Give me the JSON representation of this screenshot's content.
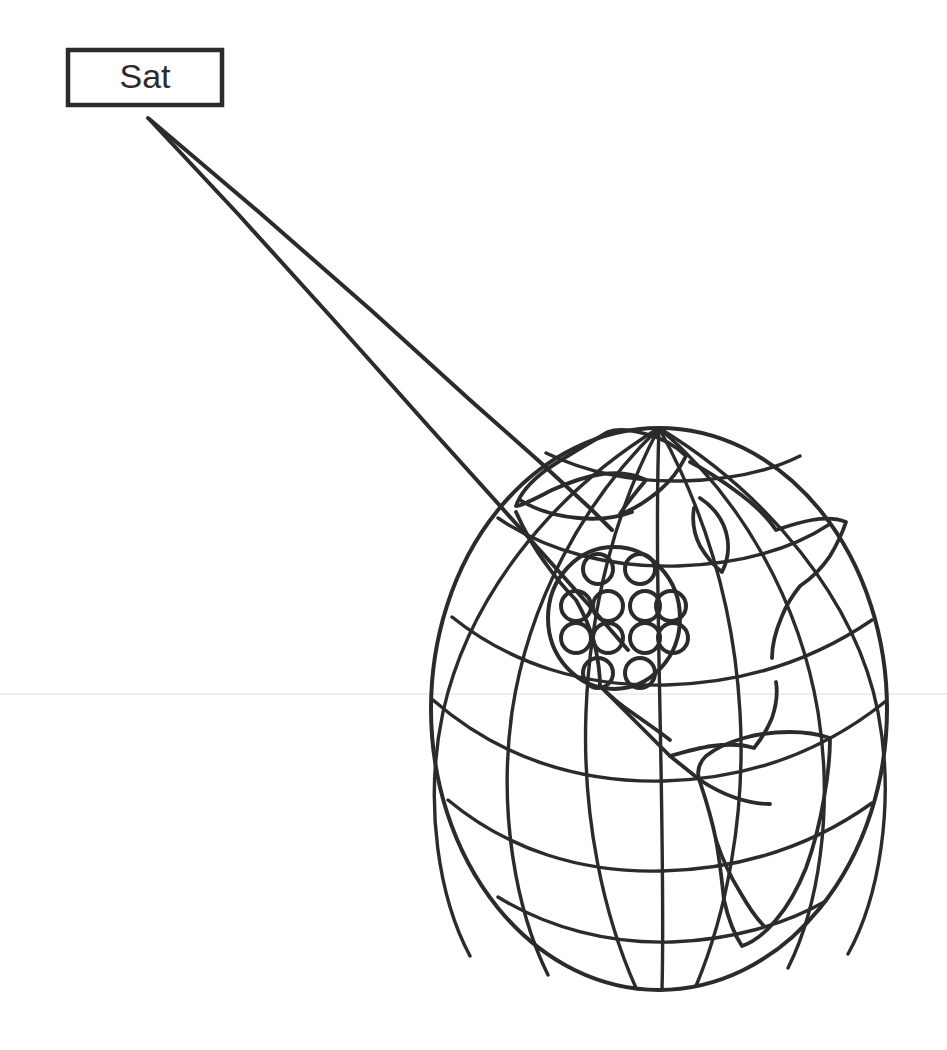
{
  "figure": {
    "background_color": "#ffffff",
    "ink_color": "#2b2b2b",
    "width": 947,
    "height": 1050
  },
  "satellite": {
    "label": "Sat",
    "box": {
      "x": 68,
      "y": 50,
      "width": 154,
      "height": 55
    },
    "box_stroke_color": "#2b2b2b",
    "box_fill_color": "#ffffff"
  },
  "beam_cone": {
    "apex": {
      "x": 148,
      "y": 118
    },
    "edge_1_end": {
      "x": 592,
      "y": 560
    },
    "edge_2_end": {
      "x": 652,
      "y": 600
    },
    "stroke_color": "#2b2b2b"
  },
  "globe": {
    "center": {
      "x": 659,
      "y": 709
    },
    "radius_x": 228,
    "radius_y": 281,
    "stroke_color": "#2b2b2b",
    "meridian_count": 7,
    "parallel_count": 6,
    "continents": [
      "North America",
      "South America",
      "Greenland",
      "Central America"
    ]
  },
  "footprint": {
    "center": {
      "x": 614,
      "y": 618
    },
    "radius_x": 66,
    "radius_y": 71,
    "spot_beam_count": 12,
    "rows": [
      2,
      4,
      4,
      2
    ],
    "spot_radius": 15,
    "stroke_color": "#2b2b2b"
  },
  "artifacts": {
    "scan_line_y": 694,
    "scan_line_color": "#e8e8e8"
  }
}
